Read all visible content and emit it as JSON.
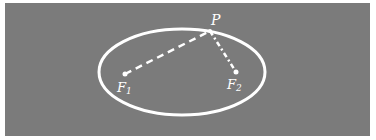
{
  "figure": {
    "background_color": "#7b7b7b",
    "stroke_color": "#ffffff",
    "ellipse": {
      "cx": 182,
      "cy": 72,
      "rx": 83,
      "ry": 43
    },
    "points": {
      "P": {
        "label": "P",
        "x": 210,
        "y": 31
      },
      "F1": {
        "label": "F",
        "subscript": "1",
        "x": 125,
        "y": 74
      },
      "F2": {
        "label": "F",
        "subscript": "2",
        "x": 236,
        "y": 72
      }
    },
    "segments": [
      {
        "from": "F1",
        "to": "P",
        "style": "dashed"
      },
      {
        "from": "P",
        "to": "F2",
        "style": "dash-dot"
      }
    ]
  }
}
